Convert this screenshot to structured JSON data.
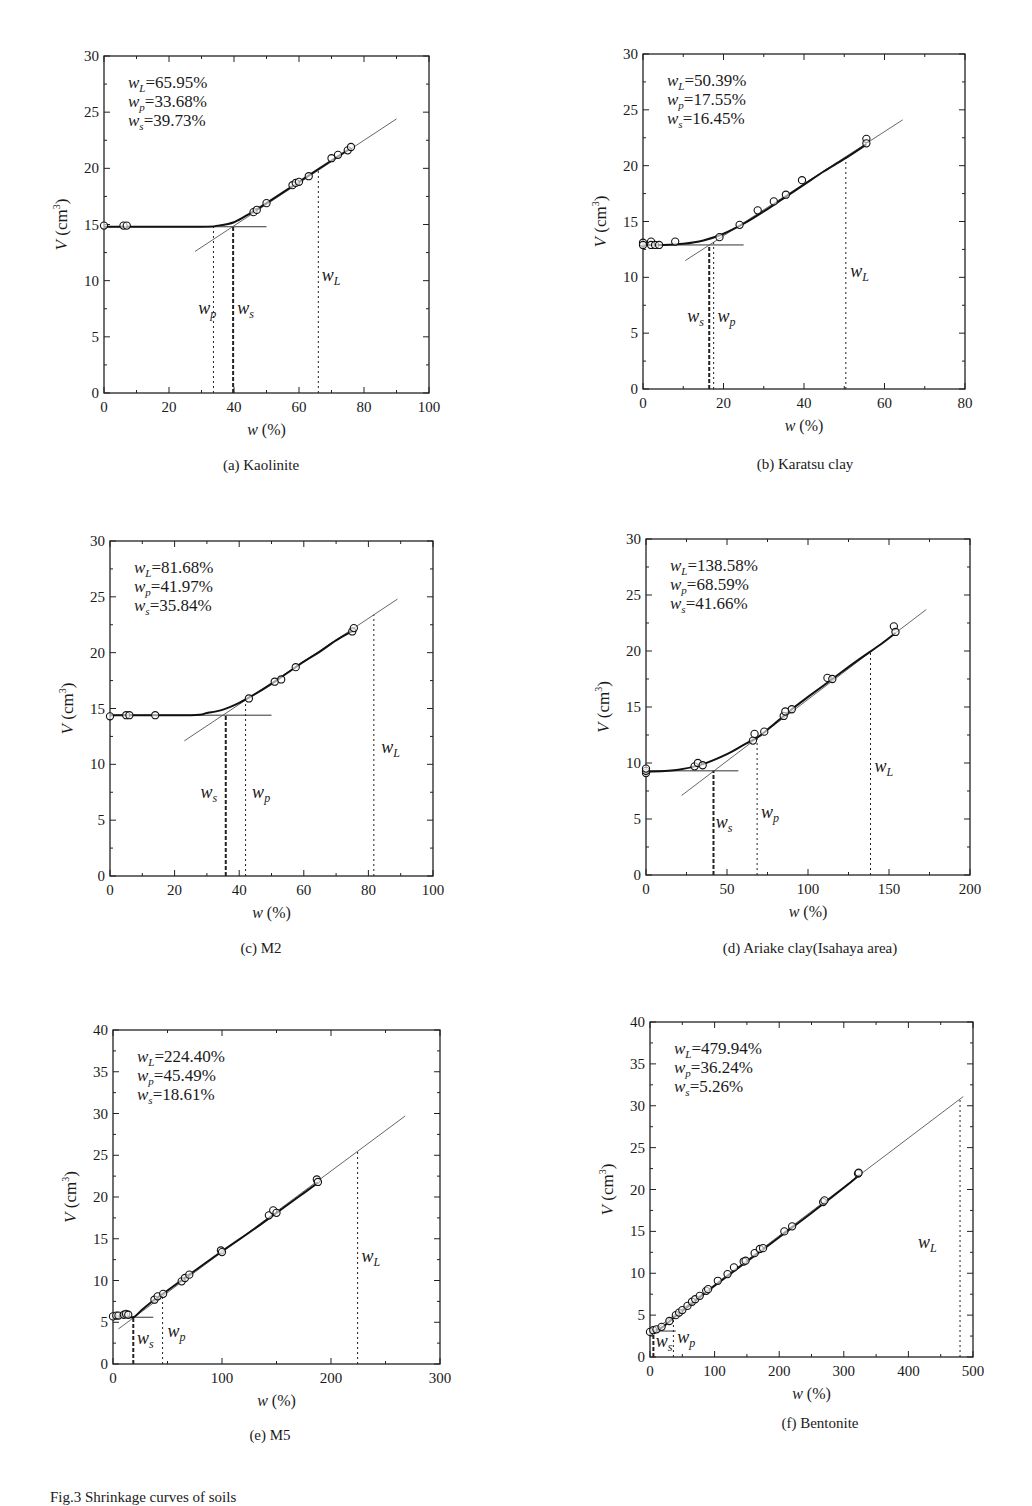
{
  "figure": {
    "caption": "Fig.3 Shrinkage curves of soils"
  },
  "chart_data": [
    {
      "id": "a",
      "type": "scatter",
      "title": "(a) Kaolinite",
      "xlabel": "w (%)",
      "ylabel": "V (cm³)",
      "xlim": [
        0,
        100
      ],
      "ylim": [
        0,
        30
      ],
      "xticks": [
        0,
        20,
        40,
        60,
        80,
        100
      ],
      "yticks": [
        0,
        5,
        10,
        15,
        20,
        25,
        30
      ],
      "annotations": {
        "wL": "65.95%",
        "wp": "33.68%",
        "ws": "39.73%"
      },
      "wL": 65.95,
      "wp": 33.68,
      "ws": 39.73,
      "V_plateau": 14.8,
      "fit_line": {
        "x": [
          28,
          90
        ],
        "y": [
          12.6,
          24.4
        ]
      },
      "plateau_line": {
        "x": [
          0,
          50
        ]
      },
      "curve": {
        "x": [
          0,
          30,
          35,
          40,
          45,
          50,
          60,
          70,
          76
        ],
        "y": [
          14.8,
          14.8,
          14.9,
          15.2,
          16.0,
          16.9,
          18.8,
          20.7,
          21.8
        ]
      },
      "points": {
        "x": [
          0,
          6,
          7,
          46,
          47,
          50,
          58,
          59,
          60,
          63,
          70,
          72,
          75,
          76
        ],
        "y": [
          14.9,
          14.9,
          14.9,
          16.1,
          16.3,
          16.9,
          18.5,
          18.7,
          18.8,
          19.3,
          20.9,
          21.2,
          21.6,
          21.9
        ]
      },
      "frame": {
        "left": 104,
        "top": 56,
        "right": 429,
        "bottom": 393
      },
      "label_pos": {
        "wp": [
          29,
          7
        ],
        "ws": [
          41,
          7
        ],
        "wL": [
          67,
          10
        ]
      }
    },
    {
      "id": "b",
      "type": "scatter",
      "title": "(b) Karatsu clay",
      "xlabel": "w (%)",
      "ylabel": "V (cm³)",
      "xlim": [
        0,
        80
      ],
      "ylim": [
        0,
        30
      ],
      "xticks": [
        0,
        20,
        40,
        60,
        80
      ],
      "yticks": [
        0,
        5,
        10,
        15,
        20,
        25,
        30
      ],
      "annotations": {
        "wL": "50.39%",
        "wp": "17.55%",
        "ws": "16.45%"
      },
      "wL": 50.39,
      "wp": 17.55,
      "ws": 16.45,
      "V_plateau": 12.9,
      "fit_line": {
        "x": [
          10.5,
          64.5
        ],
        "y": [
          11.5,
          24.1
        ]
      },
      "plateau_line": {
        "x": [
          0,
          25
        ]
      },
      "curve": {
        "x": [
          0,
          5,
          10,
          15,
          20,
          25,
          30,
          35,
          40,
          45,
          50,
          55.5
        ],
        "y": [
          12.9,
          12.9,
          13.0,
          13.3,
          13.9,
          14.8,
          15.9,
          17.1,
          18.3,
          19.5,
          20.6,
          21.9
        ]
      },
      "points": {
        "x": [
          0,
          0,
          2,
          2,
          3,
          4,
          8,
          19,
          24,
          28.5,
          32.5,
          35.5,
          39.5,
          55.5,
          55.5
        ],
        "y": [
          13.1,
          12.9,
          13.2,
          12.9,
          12.9,
          12.9,
          13.2,
          13.6,
          14.7,
          16.0,
          16.8,
          17.4,
          18.7,
          22.4,
          22.0
        ]
      },
      "frame": {
        "left": 643,
        "top": 54,
        "right": 965,
        "bottom": 389
      },
      "label_pos": {
        "ws": [
          11,
          6
        ],
        "wp": [
          18.5,
          6
        ],
        "wL": [
          51.5,
          10
        ]
      }
    },
    {
      "id": "c",
      "type": "scatter",
      "title": "(c) M2",
      "xlabel": "w (%)",
      "ylabel": "V (cm³)",
      "xlim": [
        0,
        100
      ],
      "ylim": [
        0,
        30
      ],
      "xticks": [
        0,
        20,
        40,
        60,
        80,
        100
      ],
      "yticks": [
        0,
        5,
        10,
        15,
        20,
        25,
        30
      ],
      "annotations": {
        "wL": "81.68%",
        "wp": "41.97%",
        "ws": "35.84%"
      },
      "wL": 81.68,
      "wp": 41.97,
      "ws": 35.84,
      "V_plateau": 14.4,
      "fit_line": {
        "x": [
          23,
          89
        ],
        "y": [
          12.1,
          24.8
        ]
      },
      "plateau_line": {
        "x": [
          0,
          50
        ]
      },
      "curve": {
        "x": [
          0,
          25,
          30,
          35,
          40,
          45,
          50,
          55,
          60,
          65,
          70,
          75.5
        ],
        "y": [
          14.4,
          14.4,
          14.6,
          14.9,
          15.5,
          16.3,
          17.2,
          18.2,
          19.2,
          20.1,
          21.1,
          22.0
        ]
      },
      "points": {
        "x": [
          0,
          5,
          6,
          14,
          43,
          51,
          53,
          57.5,
          75,
          75.5
        ],
        "y": [
          14.3,
          14.4,
          14.4,
          14.4,
          15.9,
          17.4,
          17.6,
          18.7,
          21.9,
          22.2
        ]
      },
      "frame": {
        "left": 110,
        "top": 541,
        "right": 433,
        "bottom": 876
      },
      "label_pos": {
        "ws": [
          28,
          7
        ],
        "wp": [
          44,
          7
        ],
        "wL": [
          84,
          11
        ]
      }
    },
    {
      "id": "d",
      "type": "scatter",
      "title": "(d) Ariake clay(Isahaya area)",
      "xlabel": "w (%)",
      "ylabel": "V (cm³)",
      "xlim": [
        0,
        200
      ],
      "ylim": [
        0,
        30
      ],
      "xticks": [
        0,
        50,
        100,
        150,
        200
      ],
      "yticks": [
        0,
        5,
        10,
        15,
        20,
        25,
        30
      ],
      "annotations": {
        "wL": "138.58%",
        "wp": "68.59%",
        "ws": "41.66%"
      },
      "wL": 138.58,
      "wp": 68.59,
      "ws": 41.66,
      "V_plateau": 9.3,
      "fit_line": {
        "x": [
          22,
          173
        ],
        "y": [
          7.1,
          23.7
        ]
      },
      "plateau_line": {
        "x": [
          0,
          57
        ]
      },
      "curve": {
        "x": [
          0,
          20,
          35,
          50,
          60,
          70,
          80,
          90,
          100,
          115,
          130,
          145,
          154
        ],
        "y": [
          9.2,
          9.4,
          9.9,
          10.8,
          11.6,
          12.4,
          13.6,
          14.8,
          15.9,
          17.5,
          19.1,
          20.6,
          21.6
        ]
      },
      "points": {
        "x": [
          0,
          0,
          0,
          30,
          32,
          35,
          66,
          67,
          73,
          85,
          86,
          90,
          112,
          115,
          153,
          154
        ],
        "y": [
          9.1,
          9.3,
          9.5,
          9.7,
          10.0,
          9.8,
          12.0,
          12.6,
          12.8,
          14.2,
          14.6,
          14.8,
          17.6,
          17.5,
          22.2,
          21.7
        ]
      },
      "frame": {
        "left": 646,
        "top": 539,
        "right": 970,
        "bottom": 875
      },
      "label_pos": {
        "ws": [
          43,
          4.2
        ],
        "wp": [
          71,
          5.1
        ],
        "wL": [
          141,
          9.2
        ]
      }
    },
    {
      "id": "e",
      "type": "scatter",
      "title": "(e) M5",
      "xlabel": "w (%)",
      "ylabel": "V (cm³)",
      "xlim": [
        0,
        300
      ],
      "ylim": [
        0,
        40
      ],
      "xticks": [
        0,
        100,
        200,
        300
      ],
      "yticks": [
        0,
        5,
        10,
        15,
        20,
        25,
        30,
        35,
        40
      ],
      "annotations": {
        "wL": "224.40%",
        "wp": "45.49%",
        "ws": "18.61%"
      },
      "wL": 224.4,
      "wp": 45.49,
      "ws": 18.61,
      "V_plateau": 5.6,
      "fit_line": {
        "x": [
          5,
          268
        ],
        "y": [
          4.2,
          29.7
        ]
      },
      "plateau_line": {
        "x": [
          0,
          37
        ]
      },
      "curve": {
        "x": [
          0,
          10,
          18.6,
          25,
          35,
          50,
          70,
          100,
          130,
          150,
          170,
          188
        ],
        "y": [
          5.6,
          5.8,
          5.6,
          6.3,
          7.4,
          8.8,
          10.7,
          13.5,
          16.2,
          18.1,
          20.0,
          21.7
        ]
      },
      "points": {
        "x": [
          0,
          3,
          5,
          10,
          12,
          14,
          38,
          41,
          46,
          63,
          66,
          70,
          99,
          100,
          143,
          147,
          150,
          187,
          188
        ],
        "y": [
          5.7,
          5.8,
          5.8,
          5.9,
          6.0,
          5.9,
          7.7,
          8.1,
          8.4,
          9.9,
          10.3,
          10.7,
          13.6,
          13.4,
          17.8,
          18.4,
          18.1,
          22.1,
          21.8
        ]
      },
      "frame": {
        "left": 113,
        "top": 1030,
        "right": 440,
        "bottom": 1364
      },
      "label_pos": {
        "ws": [
          22,
          2.4
        ],
        "wp": [
          50,
          3.2
        ],
        "wL": [
          228,
          12.2
        ]
      }
    },
    {
      "id": "f",
      "type": "scatter",
      "title": "(f) Bentonite",
      "xlabel": "w (%)",
      "ylabel": "V (cm³)",
      "xlim": [
        0,
        500
      ],
      "ylim": [
        0,
        40
      ],
      "xticks": [
        0,
        100,
        200,
        300,
        400,
        500
      ],
      "yticks": [
        0,
        5,
        10,
        15,
        20,
        25,
        30,
        35,
        40
      ],
      "annotations": {
        "wL": "479.94%",
        "wp": "36.24%",
        "ws": "5.26%"
      },
      "wL": 479.94,
      "wp": 36.24,
      "ws": 5.26,
      "V_plateau": 3.1,
      "fit_line": {
        "x": [
          5,
          485
        ],
        "y": [
          3.1,
          31.1
        ]
      },
      "plateau_line": {
        "x": [
          0,
          40
        ]
      },
      "curve": {
        "x": [
          0,
          10,
          20,
          40,
          60,
          100,
          150,
          200,
          250,
          300,
          325
        ],
        "y": [
          3.1,
          3.2,
          3.6,
          4.9,
          6.1,
          8.5,
          11.4,
          14.3,
          17.2,
          20.2,
          21.8
        ]
      },
      "points": {
        "x": [
          0,
          5,
          10,
          18,
          30,
          40,
          45,
          50,
          58,
          65,
          70,
          77,
          87,
          90,
          105,
          120,
          130,
          145,
          148,
          162,
          170,
          175,
          208,
          220,
          268,
          270,
          322,
          323
        ],
        "y": [
          3.0,
          3.2,
          3.3,
          3.6,
          4.3,
          5.0,
          5.3,
          5.6,
          6.1,
          6.6,
          6.9,
          7.3,
          7.9,
          8.1,
          9.1,
          9.9,
          10.7,
          11.4,
          11.5,
          12.4,
          12.9,
          13.0,
          15.0,
          15.6,
          18.5,
          18.7,
          21.9,
          22.0
        ]
      },
      "frame": {
        "left": 650,
        "top": 1022,
        "right": 973,
        "bottom": 1357
      },
      "label_pos": {
        "ws": [
          9,
          1.2
        ],
        "wp": [
          42,
          1.7
        ],
        "wL": [
          415,
          13.0
        ]
      }
    }
  ]
}
